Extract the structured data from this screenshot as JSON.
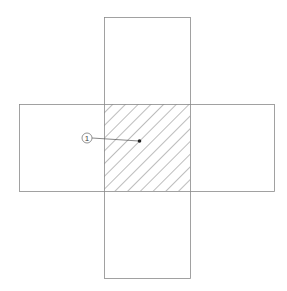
{
  "diagram": {
    "type": "cross-shaped overlap of two rectangles",
    "colors": {
      "stroke": "#8a8a8a",
      "hatch": "#5a5a5a",
      "dot": "#222222",
      "background": "#ffffff"
    },
    "horizontal_rect": {
      "x": 19,
      "y": 104,
      "width": 255,
      "height": 87
    },
    "vertical_rect": {
      "x": 104,
      "y": 17,
      "width": 86,
      "height": 261
    },
    "overlap_region": {
      "x": 104,
      "y": 104,
      "width": 86,
      "height": 87,
      "fill": "diagonal hatching"
    },
    "callout": {
      "label": "1",
      "circle_center": [
        87,
        138
      ],
      "circle_radius": 5,
      "leader_end": [
        139,
        141
      ]
    }
  }
}
